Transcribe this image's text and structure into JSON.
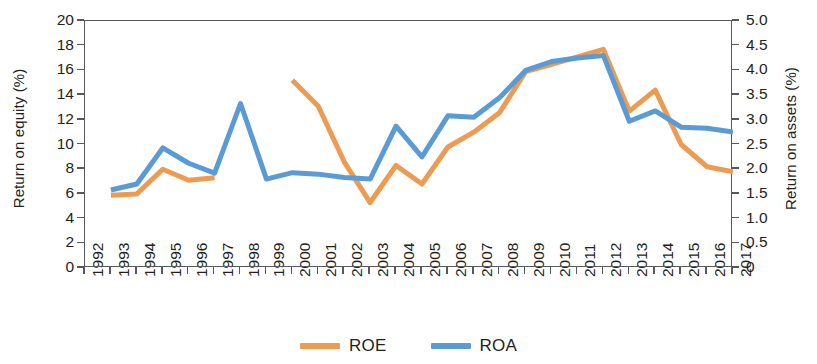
{
  "chart_data": {
    "type": "line",
    "title": "",
    "xlabel": "",
    "ylabel": "Return on equity (%)",
    "y2label": "Return on assets (%)",
    "x": [
      1992,
      1993,
      1994,
      1995,
      1996,
      1997,
      1998,
      1999,
      2000,
      2001,
      2002,
      2003,
      2004,
      2005,
      2006,
      2007,
      2008,
      2009,
      2010,
      2011,
      2012,
      2013,
      2014,
      2015,
      2016,
      2017
    ],
    "xtick_labels": [
      "1992",
      "1993",
      "1994",
      "1995",
      "1996",
      "1997",
      "1998",
      "1999",
      "2000",
      "2001",
      "2002",
      "2003",
      "2004",
      "2005",
      "2006",
      "2007",
      "2008",
      "2009",
      "2010",
      "2011",
      "2012",
      "2013",
      "2014",
      "2015",
      "2016",
      "2017"
    ],
    "ylim": [
      0,
      20
    ],
    "ytick_labels": [
      "0",
      "2",
      "4",
      "6",
      "8",
      "10",
      "12",
      "14",
      "16",
      "18",
      "20"
    ],
    "ytick_values": [
      0,
      2,
      4,
      6,
      8,
      10,
      12,
      14,
      16,
      18,
      20
    ],
    "y2lim": [
      0,
      5.0
    ],
    "y2tick_labels": [
      "0",
      "0.5",
      "1.0",
      "1.5",
      "2.0",
      "2.5",
      "3.0",
      "3.5",
      "4.0",
      "4.5",
      "5.0"
    ],
    "y2tick_values": [
      0,
      0.5,
      1.0,
      1.5,
      2.0,
      2.5,
      3.0,
      3.5,
      4.0,
      4.5,
      5.0
    ],
    "grid": false,
    "legend_position": "bottom-center",
    "series": [
      {
        "name": "ROE",
        "axis": "left",
        "color": "#ED9B53",
        "values": [
          null,
          5.9,
          6.0,
          8.0,
          7.1,
          7.3,
          null,
          null,
          15.2,
          13.1,
          8.6,
          5.3,
          8.3,
          6.8,
          9.8,
          11.0,
          12.6,
          15.9,
          16.5,
          17.1,
          17.7,
          12.7,
          14.4,
          10.0,
          8.2,
          7.8
        ]
      },
      {
        "name": "ROA",
        "axis": "right",
        "color": "#5B9BD5",
        "values": [
          null,
          1.58,
          1.7,
          2.43,
          2.12,
          1.92,
          3.33,
          1.8,
          1.93,
          1.9,
          1.83,
          1.8,
          2.87,
          2.25,
          3.08,
          3.05,
          3.45,
          4.0,
          4.18,
          4.25,
          4.3,
          2.97,
          3.18,
          2.85,
          2.83,
          2.75
        ]
      }
    ],
    "series_left_equivalent": [
      {
        "name": "ROA",
        "note": "ROA plotted on right axis; left-axis pixel-equivalent values",
        "values": [
          null,
          6.3,
          6.8,
          9.7,
          8.5,
          7.7,
          13.3,
          7.2,
          7.7,
          7.6,
          7.3,
          7.2,
          11.5,
          9.0,
          12.3,
          12.2,
          13.8,
          16.0,
          16.7,
          17.0,
          17.2,
          11.9,
          12.7,
          11.4,
          11.3,
          11.0
        ]
      }
    ]
  },
  "axes": {
    "left_title": "Return on equity (%)",
    "right_title": "Return on assets (%)"
  },
  "legend": {
    "items": [
      {
        "label": "ROE",
        "color": "#ED9B53"
      },
      {
        "label": "ROA",
        "color": "#5B9BD5"
      }
    ]
  }
}
